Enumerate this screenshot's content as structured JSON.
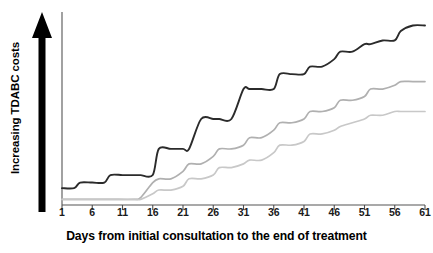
{
  "chart_data": {
    "type": "line",
    "title": "",
    "xlabel": "Days from initial consultation to the end of treatment",
    "ylabel": "Increasing TDABC costs",
    "x_ticks": [
      1,
      6,
      11,
      16,
      21,
      26,
      31,
      36,
      41,
      46,
      51,
      56,
      61
    ],
    "xlim": [
      1,
      61
    ],
    "ylim": [
      0,
      100
    ],
    "grid": false,
    "legend": "none",
    "y_axis_style": "arrow-increasing-no-ticks",
    "annotations": [
      "Thick black upward arrow indicates increasing TDABC costs",
      "Y axis has no numeric tick labels"
    ],
    "series": [
      {
        "name": "pathway-high-cost",
        "color": "#2b2b2b",
        "width": 1.9,
        "x": [
          1,
          3,
          4,
          6,
          8,
          9,
          11,
          13,
          14,
          16,
          17,
          19,
          21,
          22,
          24,
          26,
          27,
          29,
          31,
          32,
          34,
          36,
          37,
          39,
          41,
          42,
          44,
          46,
          47,
          49,
          51,
          52,
          54,
          56,
          57,
          59,
          61
        ],
        "y": [
          9,
          9,
          12,
          12,
          12,
          16,
          16,
          16,
          16,
          16,
          30,
          30,
          30,
          30,
          46,
          46,
          46,
          46,
          62,
          62,
          62,
          62,
          70,
          70,
          70,
          74,
          74,
          78,
          82,
          82,
          86,
          86,
          88,
          88,
          93,
          96,
          96
        ]
      },
      {
        "name": "pathway-medium-cost",
        "color": "#b0b0b0",
        "width": 1.7,
        "x": [
          1,
          5,
          9,
          13,
          14,
          16,
          17,
          19,
          21,
          22,
          24,
          26,
          27,
          29,
          31,
          32,
          34,
          36,
          37,
          39,
          41,
          42,
          44,
          46,
          47,
          49,
          51,
          52,
          54,
          56,
          57,
          59,
          61
        ],
        "y": [
          3,
          3,
          3,
          3,
          4,
          12,
          14,
          14,
          18,
          22,
          22,
          26,
          30,
          30,
          32,
          36,
          36,
          40,
          44,
          44,
          46,
          50,
          50,
          52,
          56,
          56,
          58,
          62,
          62,
          64,
          66,
          66,
          66
        ]
      },
      {
        "name": "pathway-low-cost",
        "color": "#c8c8c8",
        "width": 1.7,
        "x": [
          1,
          5,
          9,
          13,
          14,
          16,
          17,
          19,
          21,
          22,
          24,
          26,
          27,
          29,
          31,
          32,
          34,
          36,
          37,
          39,
          41,
          42,
          44,
          46,
          47,
          49,
          51,
          52,
          54,
          56,
          57,
          59,
          61
        ],
        "y": [
          3,
          3,
          3,
          3,
          3,
          6,
          8,
          8,
          10,
          14,
          14,
          16,
          20,
          20,
          22,
          24,
          24,
          28,
          32,
          32,
          34,
          38,
          38,
          40,
          42,
          44,
          46,
          48,
          48,
          50,
          50,
          50,
          50
        ]
      }
    ]
  },
  "axis": {
    "y_arrow_name": "increasing-costs-arrow",
    "y_label": "Increasing TDABC costs",
    "x_title": "Days from initial consultation to the end of treatment",
    "tick_labels": [
      "1",
      "6",
      "11",
      "16",
      "21",
      "26",
      "31",
      "36",
      "41",
      "46",
      "51",
      "56",
      "61"
    ]
  },
  "colors": {
    "axis": "#4d4d4d",
    "arrow": "#000000",
    "text": "#000000",
    "series_high": "#2b2b2b",
    "series_medium": "#b0b0b0",
    "series_low": "#c8c8c8"
  }
}
